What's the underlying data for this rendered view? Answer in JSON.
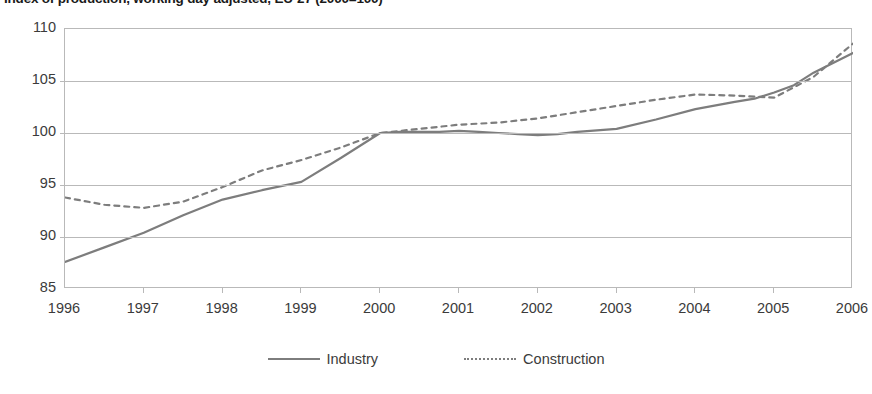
{
  "chart_data": {
    "type": "line",
    "title": "Index of production, working day adjusted, EU-27 (2000=100)",
    "xlabel": "",
    "ylabel": "",
    "ylim": [
      85,
      110
    ],
    "yticks": [
      85,
      90,
      95,
      100,
      105,
      110
    ],
    "ytick_labels": [
      "85",
      "90",
      "95",
      "100",
      "105",
      "110"
    ],
    "xlim": [
      1996,
      2006
    ],
    "xticks": [
      1996,
      1997,
      1998,
      1999,
      2000,
      2001,
      2002,
      2003,
      2004,
      2005,
      2006
    ],
    "xtick_labels": [
      "1996",
      "1997",
      "1998",
      "1999",
      "2000",
      "2001",
      "2002",
      "2003",
      "2004",
      "2005",
      "2006"
    ],
    "grid": true,
    "legend_position": "bottom",
    "series": [
      {
        "name": "Industry",
        "style": "solid",
        "color": "#7d7d7d",
        "x": [
          1996.0,
          1996.5,
          1997.0,
          1997.5,
          1998.0,
          1998.5,
          1999.0,
          1999.5,
          2000.0,
          2000.25,
          2000.5,
          2000.75,
          2001.0,
          2001.25,
          2001.5,
          2001.75,
          2002.0,
          2002.25,
          2002.5,
          2003.0,
          2003.5,
          2004.0,
          2004.5,
          2004.75,
          2005.0,
          2005.25,
          2005.5,
          2006.0
        ],
        "values": [
          87.6,
          89.0,
          90.4,
          92.1,
          93.6,
          94.5,
          95.3,
          97.6,
          100.0,
          100.1,
          100.1,
          100.1,
          100.2,
          100.1,
          100.0,
          99.9,
          99.8,
          99.9,
          100.1,
          100.4,
          101.3,
          102.3,
          103.0,
          103.3,
          103.9,
          104.6,
          105.8,
          107.7
        ]
      },
      {
        "name": "Construction",
        "style": "dashed",
        "color": "#7d7d7d",
        "x": [
          1996.0,
          1996.5,
          1997.0,
          1997.5,
          1998.0,
          1998.5,
          1999.0,
          1999.5,
          2000.0,
          2000.5,
          2001.0,
          2001.5,
          2002.0,
          2002.5,
          2003.0,
          2003.5,
          2004.0,
          2004.5,
          2005.0,
          2005.5,
          2006.0
        ],
        "values": [
          93.8,
          93.1,
          92.8,
          93.4,
          94.8,
          96.4,
          97.4,
          98.6,
          100.0,
          100.4,
          100.8,
          101.0,
          101.4,
          102.0,
          102.6,
          103.2,
          103.7,
          103.6,
          103.4,
          105.4,
          108.6
        ]
      }
    ]
  },
  "legend": {
    "items": [
      {
        "label": "Industry",
        "style": "solid"
      },
      {
        "label": "Construction",
        "style": "dashed"
      }
    ]
  }
}
